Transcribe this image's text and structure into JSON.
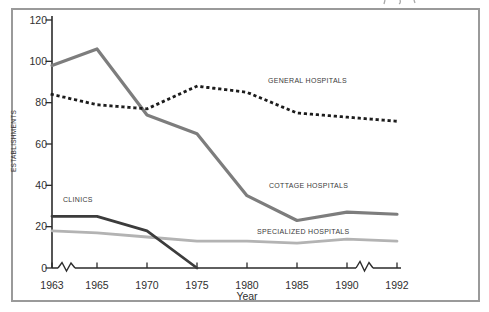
{
  "chart_data": {
    "type": "line",
    "title": "",
    "xlabel": "Year",
    "ylabel": "ESTABLISHMENTS",
    "x": [
      1963,
      1965,
      1970,
      1975,
      1980,
      1985,
      1990,
      1992
    ],
    "xticks": [
      "1963",
      "1965",
      "1970",
      "1975",
      "1980",
      "1985",
      "1990",
      "1992"
    ],
    "yticks": [
      "120",
      "100",
      "80",
      "60",
      "40",
      "20",
      "0"
    ],
    "ylim": [
      0,
      120
    ],
    "grid": false,
    "legend_position": "inline-annotations",
    "x_axis_breaks": [
      "1963-1965",
      "1990-1992"
    ],
    "series": [
      {
        "name": "GENERAL HOSPITALS",
        "line_style": "dotted",
        "color": "#1c1c1c",
        "stroke_width": 2.8,
        "x": [
          1963,
          1965,
          1970,
          1975,
          1980,
          1985,
          1990,
          1992
        ],
        "values": [
          84,
          79,
          77,
          88,
          85,
          75,
          73,
          71
        ]
      },
      {
        "name": "COTTAGE HOSPITALS",
        "line_style": "solid",
        "color": "#7d7d7d",
        "stroke_width": 3.2,
        "x": [
          1963,
          1965,
          1970,
          1975,
          1980,
          1985,
          1990,
          1992
        ],
        "values": [
          98,
          106,
          74,
          65,
          35,
          23,
          27,
          26
        ]
      },
      {
        "name": "CLINICS",
        "line_style": "solid",
        "color": "#3c3c3c",
        "stroke_width": 2.8,
        "x": [
          1963,
          1965,
          1970,
          1975
        ],
        "values": [
          25,
          25,
          18,
          0
        ]
      },
      {
        "name": "SPECIALIZED HOSPITALS",
        "line_style": "solid",
        "color": "#b3b3b3",
        "stroke_width": 2.8,
        "x": [
          1963,
          1965,
          1970,
          1975,
          1980,
          1985,
          1990,
          1992
        ],
        "values": [
          18,
          17,
          15,
          13,
          13,
          12,
          14,
          13
        ]
      }
    ],
    "colors": {
      "axis": "#2b2b2b",
      "frame": "#9a9a9a",
      "tick_text": "#2f2f2f",
      "annotation_text": "#3a3a3a",
      "background": "#ffffff"
    }
  }
}
